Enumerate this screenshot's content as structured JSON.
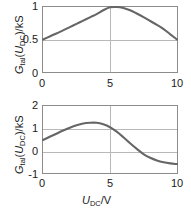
{
  "figure": {
    "background_color": "#ffffff",
    "curve_color": "#666666",
    "frame_color": "#8c8c8c",
    "grid_color": "#b8b8b8"
  },
  "panels": {
    "top": {
      "ylabel_main": "G",
      "ylabel_sub": "tal",
      "ylabel_tail_var": "U",
      "ylabel_tail_sub": "DC",
      "ylabel_tail_unit": ")/kS",
      "yticks": [
        "0",
        "0.5",
        "1"
      ],
      "xticks": [
        "0",
        "5",
        "10"
      ]
    },
    "bottom": {
      "ylabel_main": "G",
      "ylabel_sub": "tal",
      "ylabel_tail_var": "U",
      "ylabel_tail_sub": "DC",
      "ylabel_tail_unit": ")/kS",
      "yticks": [
        "-1",
        "0",
        "1",
        "2"
      ],
      "xticks": [
        "0",
        "5",
        "10"
      ],
      "xlabel_var": "U",
      "xlabel_sub": "DC",
      "xlabel_unit": "/V"
    }
  },
  "chart_data": [
    {
      "type": "line",
      "title": "",
      "xlabel": "",
      "ylabel": "G_tal(U_DC)/kS",
      "xlim": [
        0,
        10
      ],
      "ylim": [
        0,
        1
      ],
      "xticks": [
        0,
        5,
        10
      ],
      "yticks": [
        0,
        0.5,
        1
      ],
      "grid": true,
      "legend": null,
      "series": [
        {
          "name": "G_tal",
          "x": [
            0,
            0.5,
            1,
            1.5,
            2,
            2.5,
            3,
            3.5,
            4,
            4.5,
            5,
            5.5,
            6,
            6.5,
            7,
            7.5,
            8,
            8.5,
            9,
            9.5,
            10
          ],
          "y": [
            0.5,
            0.545,
            0.592,
            0.64,
            0.69,
            0.74,
            0.79,
            0.84,
            0.89,
            0.95,
            0.995,
            1.0,
            0.985,
            0.95,
            0.9,
            0.845,
            0.785,
            0.725,
            0.66,
            0.58,
            0.5
          ]
        }
      ]
    },
    {
      "type": "line",
      "title": "",
      "xlabel": "U_DC/V",
      "ylabel": "G_tal(U_DC)/kS",
      "xlim": [
        0,
        10
      ],
      "ylim": [
        -1,
        2
      ],
      "xticks": [
        0,
        5,
        10
      ],
      "yticks": [
        -1,
        0,
        1,
        2
      ],
      "grid": true,
      "legend": null,
      "series": [
        {
          "name": "G_tal",
          "x": [
            0,
            0.5,
            1,
            1.5,
            2,
            2.5,
            3,
            3.5,
            4,
            4.5,
            5,
            5.5,
            6,
            6.5,
            7,
            7.5,
            8,
            8.5,
            9,
            9.5,
            10
          ],
          "y": [
            0.48,
            0.62,
            0.76,
            0.9,
            1.03,
            1.14,
            1.22,
            1.25,
            1.25,
            1.18,
            1.05,
            0.85,
            0.6,
            0.33,
            0.08,
            -0.15,
            -0.32,
            -0.44,
            -0.52,
            -0.57,
            -0.6
          ]
        }
      ]
    }
  ]
}
